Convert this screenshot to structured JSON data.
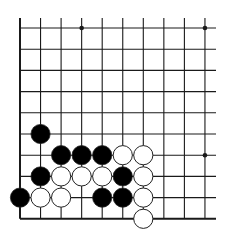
{
  "board": {
    "description": "Go board corner diagram (bottom-left corner)",
    "columns": 10,
    "rows": 10,
    "grid": {
      "x0": 20,
      "x_step": 20.55,
      "y0": 28,
      "y_step": 21.2,
      "top_extend": 18,
      "right_extend": 216
    },
    "colors": {
      "line": "#1a1a1a",
      "black_stone": "#000000",
      "white_stone": "#ffffff",
      "stone_outline": "#222222",
      "background": "#ffffff"
    },
    "star_points": [
      {
        "col": 3,
        "row": 0
      },
      {
        "col": 9,
        "row": 0
      },
      {
        "col": 9,
        "row": 6
      }
    ],
    "stones": [
      {
        "color": "black",
        "col": 1,
        "row": 5
      },
      {
        "color": "black",
        "col": 2,
        "row": 6
      },
      {
        "color": "black",
        "col": 3,
        "row": 6
      },
      {
        "color": "black",
        "col": 4,
        "row": 6
      },
      {
        "color": "white",
        "col": 5,
        "row": 6
      },
      {
        "color": "white",
        "col": 6,
        "row": 6
      },
      {
        "color": "black",
        "col": 1,
        "row": 7
      },
      {
        "color": "white",
        "col": 2,
        "row": 7
      },
      {
        "color": "white",
        "col": 3,
        "row": 7
      },
      {
        "color": "white",
        "col": 4,
        "row": 7
      },
      {
        "color": "black",
        "col": 5,
        "row": 7
      },
      {
        "color": "white",
        "col": 6,
        "row": 7
      },
      {
        "color": "black",
        "col": 0,
        "row": 8
      },
      {
        "color": "white",
        "col": 1,
        "row": 8
      },
      {
        "color": "white",
        "col": 2,
        "row": 8
      },
      {
        "color": "black",
        "col": 4,
        "row": 8
      },
      {
        "color": "black",
        "col": 5,
        "row": 8
      },
      {
        "color": "white",
        "col": 6,
        "row": 8
      },
      {
        "color": "white",
        "col": 6,
        "row": 9
      }
    ]
  }
}
